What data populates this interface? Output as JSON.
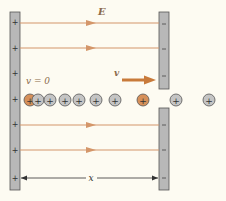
{
  "diagram": {
    "type": "electric-field-ion-acceleration",
    "labels": {
      "field": "E",
      "initial_velocity": "v = 0",
      "final_velocity": "v",
      "distance": "x"
    },
    "left_plate": {
      "charge": "+",
      "sign_count": 7
    },
    "right_plate": {
      "charge": "−",
      "has_aperture": true,
      "sign_count": 6
    },
    "field_lines_count": 4,
    "ions": [
      {
        "sign": "+",
        "highlighted": true
      },
      {
        "sign": "+",
        "highlighted": false
      },
      {
        "sign": "+",
        "highlighted": false
      },
      {
        "sign": "+",
        "highlighted": false
      },
      {
        "sign": "+",
        "highlighted": false
      },
      {
        "sign": "+",
        "highlighted": false
      },
      {
        "sign": "+",
        "highlighted": false
      },
      {
        "sign": "+",
        "highlighted": true
      },
      {
        "sign": "+",
        "highlighted": false
      },
      {
        "sign": "+",
        "highlighted": false
      }
    ],
    "colors": {
      "background": "#fdfbf2",
      "plate": "#b8b8b8",
      "plate_border": "#555555",
      "field_line": "#d4966a",
      "velocity_arrow": "#c87a3a",
      "ion_normal": "#c4c4c4",
      "ion_highlight": "#d6905a",
      "label": "#8a6a4a"
    }
  }
}
